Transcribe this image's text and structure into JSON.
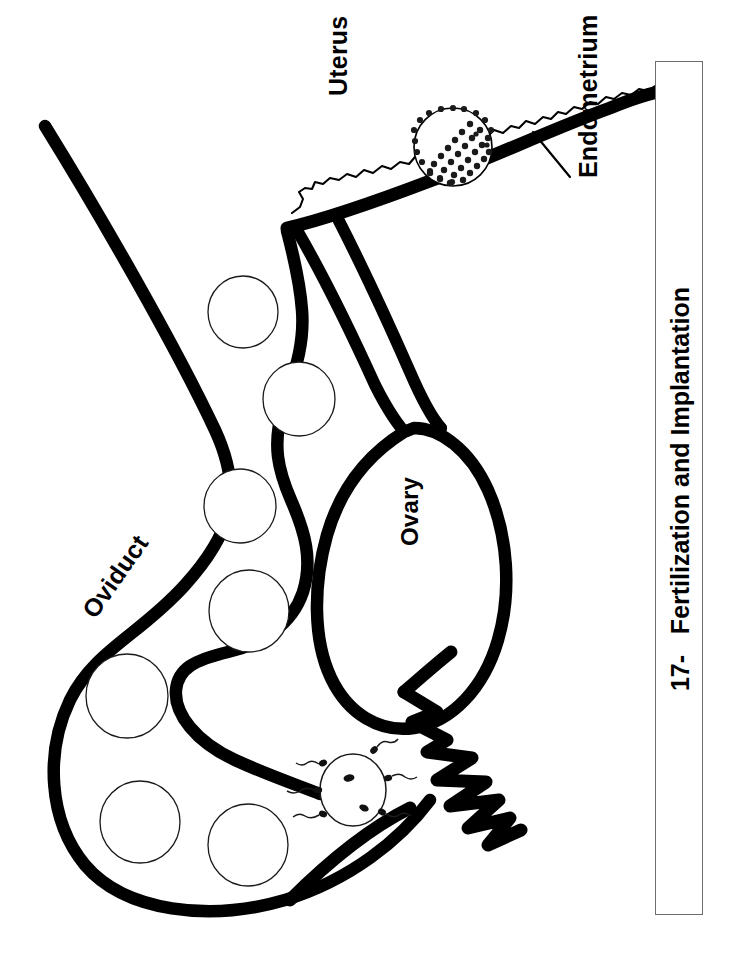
{
  "figure": {
    "caption_number": "17-",
    "caption_title": "Fertilization and Implantation",
    "caption_full": "17-   Fertilization and Implantation",
    "background_color": "#ffffff",
    "ink_color": "#000000",
    "caption_box_border_color": "#6d6d6d"
  },
  "labels": {
    "uterus": "Uterus",
    "endometrium": "Endometrium",
    "ovary": "Ovary",
    "oviduct": "Oviduct"
  },
  "structures": {
    "oviduct": {
      "name": "Oviduct",
      "description": "thick-outlined looping tube containing a chain of developing embryo circles"
    },
    "uterus": {
      "name": "Uterus",
      "description": "thick wall with a thin wavy inner endometrium lining"
    },
    "endometrium": {
      "name": "Endometrium",
      "description": "thin wavy inner uterine lining with leader line"
    },
    "ovary": {
      "name": "Ovary",
      "description": "large oval organ adjacent to the oviduct"
    },
    "fimbriae": {
      "name": "Fimbriae",
      "description": "zigzag finger-like projections at the open end of the oviduct"
    },
    "ovum": {
      "name": "Ovum",
      "description": "circle with two nuclei surrounded by sperm with wavy tails"
    },
    "blastocyst": {
      "name": "Blastocyst",
      "description": "circle with beaded trophoblast rim and stippled inner cell mass implanting in the endometrium"
    }
  },
  "embryo_circles": [
    {
      "cx": 243,
      "cy": 312,
      "rx": 35,
      "ry": 36
    },
    {
      "cx": 299,
      "cy": 399,
      "rx": 36,
      "ry": 37
    },
    {
      "cx": 240,
      "cy": 506,
      "rx": 36,
      "ry": 37
    },
    {
      "cx": 249,
      "cy": 611,
      "rx": 40,
      "ry": 41
    },
    {
      "cx": 127,
      "cy": 696,
      "rx": 41,
      "ry": 42
    },
    {
      "cx": 140,
      "cy": 822,
      "rx": 40,
      "ry": 41
    },
    {
      "cx": 248,
      "cy": 845,
      "rx": 40,
      "ry": 41
    }
  ],
  "sperm": [
    {
      "hx": 322,
      "hy": 780,
      "angle": 200
    },
    {
      "hx": 324,
      "hy": 812,
      "angle": 205
    },
    {
      "hx": 330,
      "hy": 760,
      "angle": 215
    },
    {
      "hx": 386,
      "hy": 767,
      "angle": 25
    },
    {
      "hx": 390,
      "hy": 805,
      "angle": 40
    },
    {
      "hx": 382,
      "hy": 748,
      "angle": 55
    }
  ],
  "ovum_nuclei": [
    {
      "cx": 349,
      "cy": 778
    },
    {
      "cx": 362,
      "cy": 807
    }
  ]
}
